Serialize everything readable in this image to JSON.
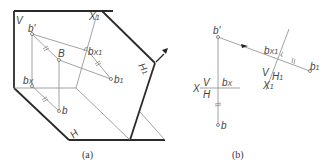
{
  "figure": {
    "panel_a": {
      "caption": "(a)",
      "labels": {
        "V": "V",
        "H": "H",
        "X1": "X",
        "X1_sub": "1",
        "H1": "H",
        "H1_sub": "1",
        "b_prime": "b'",
        "B": "B",
        "bx": "b",
        "bx_sub": "X",
        "b": "b",
        "b1": "b",
        "b1_sub": "1",
        "bx1": "b",
        "bx1_sub": "X1"
      }
    },
    "panel_b": {
      "caption": "(b)",
      "labels": {
        "b_prime": "b'",
        "bx1": "b",
        "bx1_sub": "X1",
        "b1": "b",
        "b1_sub": "1",
        "V_over_H1": "V",
        "H1": "H",
        "H1_sub": "1",
        "X1": "X",
        "X1_sub": "1",
        "x": "X",
        "V": "V",
        "H": "H",
        "bx": "b",
        "bx_sub": "X",
        "b": "b"
      }
    }
  }
}
